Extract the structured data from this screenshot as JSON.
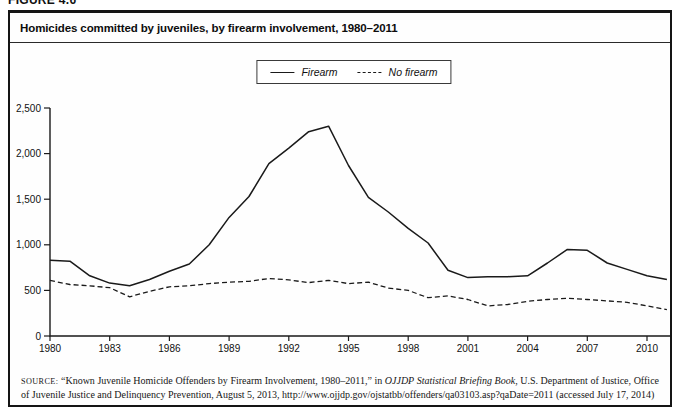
{
  "figure_label": "FIGURE 4.6",
  "figure": {
    "title": "Homicides committed by juveniles, by firearm involvement, 1980–2011",
    "source": {
      "label": "SOURCE:",
      "pre": " “Known Juvenile Homicide Offenders by Firearm Involvement, 1980–2011,” in ",
      "italic": "OJJDP Statistical Briefing Book",
      "post": ", U.S. Department of Justice, Office of Juvenile Justice and Delinquency Prevention, August 5, 2013, http://www.ojjdp.gov/ojstatbb/offenders/qa03103.asp?qaDate=2011 (accessed July 17, 2014)"
    }
  },
  "chart_data": {
    "type": "line",
    "title": "Homicides committed by juveniles, by firearm involvement, 1980–2011",
    "xlabel": "",
    "ylabel": "",
    "ylim": [
      0,
      2500
    ],
    "grid": false,
    "legend_position": "top-center",
    "line_color": "#1a1a1a",
    "yticks": [
      0,
      500,
      1000,
      1500,
      2000,
      2500
    ],
    "ytick_labels": [
      "0",
      "500",
      "1,000",
      "1,500",
      "2,000",
      "2,500"
    ],
    "xticks": [
      1980,
      1983,
      1986,
      1989,
      1992,
      1995,
      1998,
      2001,
      2004,
      2007,
      2010
    ],
    "x": [
      1980,
      1981,
      1982,
      1983,
      1984,
      1985,
      1986,
      1987,
      1988,
      1989,
      1990,
      1991,
      1992,
      1993,
      1994,
      1995,
      1996,
      1997,
      1998,
      1999,
      2000,
      2001,
      2002,
      2003,
      2004,
      2005,
      2006,
      2007,
      2008,
      2009,
      2010,
      2011
    ],
    "series": [
      {
        "name": "Firearm",
        "style": "solid",
        "values": [
          830,
          820,
          660,
          580,
          550,
          620,
          710,
          790,
          1000,
          1300,
          1530,
          1890,
          2060,
          2240,
          2300,
          1870,
          1520,
          1360,
          1180,
          1020,
          720,
          640,
          650,
          650,
          660,
          800,
          950,
          940,
          800,
          730,
          660,
          620
        ]
      },
      {
        "name": "No firearm",
        "style": "dashed",
        "values": [
          610,
          565,
          550,
          530,
          430,
          490,
          540,
          550,
          575,
          590,
          600,
          630,
          615,
          585,
          610,
          575,
          590,
          525,
          500,
          420,
          440,
          400,
          330,
          345,
          380,
          400,
          415,
          400,
          385,
          370,
          330,
          290
        ]
      }
    ]
  }
}
